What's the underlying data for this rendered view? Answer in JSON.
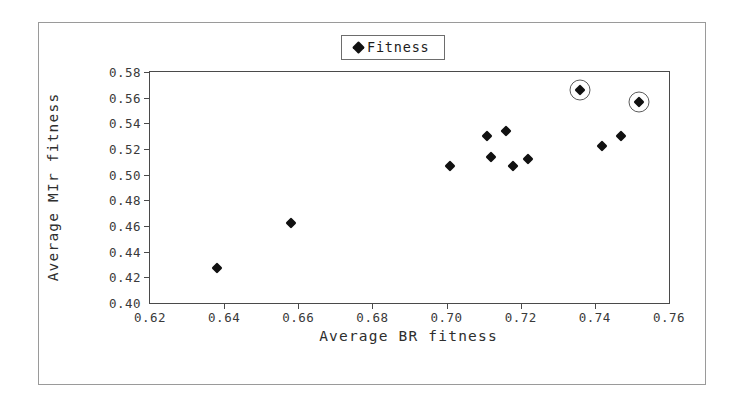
{
  "chart_data": {
    "type": "scatter",
    "title": "",
    "xlabel": "Average BR fitness",
    "ylabel": "Average MIr fitness",
    "xlim": [
      0.62,
      0.76
    ],
    "ylim": [
      0.4,
      0.58
    ],
    "xticks": [
      "0.62",
      "0.64",
      "0.66",
      "0.68",
      "0.70",
      "0.72",
      "0.74",
      "0.76"
    ],
    "yticks": [
      "0.40",
      "0.42",
      "0.44",
      "0.46",
      "0.48",
      "0.50",
      "0.52",
      "0.54",
      "0.56",
      "0.58"
    ],
    "xtick_values": [
      0.62,
      0.64,
      0.66,
      0.68,
      0.7,
      0.72,
      0.74,
      0.76
    ],
    "ytick_values": [
      0.4,
      0.42,
      0.44,
      0.46,
      0.48,
      0.5,
      0.52,
      0.54,
      0.56,
      0.58
    ],
    "grid": false,
    "legend_position": "top-center",
    "series": [
      {
        "name": "Fitness",
        "marker": "diamond",
        "color": "#111111",
        "points": [
          {
            "x": 0.638,
            "y": 0.427,
            "highlighted": false
          },
          {
            "x": 0.658,
            "y": 0.462,
            "highlighted": false
          },
          {
            "x": 0.701,
            "y": 0.507,
            "highlighted": false
          },
          {
            "x": 0.711,
            "y": 0.53,
            "highlighted": false
          },
          {
            "x": 0.712,
            "y": 0.514,
            "highlighted": false
          },
          {
            "x": 0.716,
            "y": 0.534,
            "highlighted": false
          },
          {
            "x": 0.718,
            "y": 0.507,
            "highlighted": false
          },
          {
            "x": 0.722,
            "y": 0.512,
            "highlighted": false
          },
          {
            "x": 0.742,
            "y": 0.522,
            "highlighted": false
          },
          {
            "x": 0.747,
            "y": 0.53,
            "highlighted": false
          },
          {
            "x": 0.736,
            "y": 0.566,
            "highlighted": true
          },
          {
            "x": 0.752,
            "y": 0.557,
            "highlighted": true
          }
        ]
      }
    ]
  },
  "legend": {
    "entries": [
      {
        "label": "Fitness",
        "marker": "diamond-marker-icon",
        "color": "#111111"
      }
    ]
  },
  "colors": {
    "frame": "#4a4a4a",
    "figure_border": "#9a9a9a",
    "marker": "#111111",
    "highlight_ring": "#5c5c5c",
    "text": "#2e2e2e",
    "background": "#ffffff"
  }
}
